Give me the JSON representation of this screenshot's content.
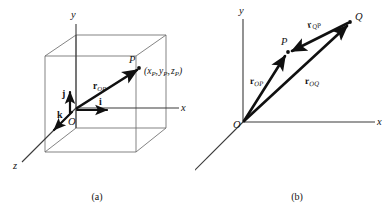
{
  "figure": {
    "background_color": "#ffffff",
    "ink_color": "#101010",
    "axis_color": "#3a3a3a",
    "cube_edge_color": "#6e6e6e"
  },
  "panel_a": {
    "caption": "(a)",
    "axes": [
      {
        "name": "y-axis",
        "label": "y"
      },
      {
        "name": "x-axis",
        "label": "x"
      },
      {
        "name": "z-axis",
        "label": "z"
      }
    ],
    "origin_label": "O",
    "point_label": "P",
    "coordinate_label": {
      "open": "(",
      "x_base": "x",
      "x_sub": "P",
      "sep1": ",",
      "y_base": "y",
      "y_sub": "P",
      "sep2": ",",
      "z_base": "z",
      "z_sub": "P",
      "close": ")"
    },
    "unit_vectors": [
      {
        "name": "i-hat",
        "label": "i",
        "direction": "x"
      },
      {
        "name": "j-hat",
        "label": "j",
        "direction": "y"
      },
      {
        "name": "k-hat",
        "label": "k",
        "direction": "z"
      }
    ],
    "vectors": [
      {
        "name": "r-OP",
        "base": "r",
        "sub": "OP",
        "from": "O",
        "to": "P"
      }
    ]
  },
  "panel_b": {
    "caption": "(b)",
    "axes": [
      {
        "name": "y-axis",
        "label": "y"
      },
      {
        "name": "x-axis",
        "label": "x"
      },
      {
        "name": "z-axis",
        "label": "z"
      }
    ],
    "origin_label": "O",
    "point_labels": [
      {
        "name": "point-P",
        "label": "P"
      },
      {
        "name": "point-Q",
        "label": "Q"
      }
    ],
    "vectors": [
      {
        "name": "r-OP",
        "base": "r",
        "sub": "OP",
        "from": "O",
        "to": "P"
      },
      {
        "name": "r-OQ",
        "base": "r",
        "sub": "OQ",
        "from": "O",
        "to": "Q"
      },
      {
        "name": "r-QP",
        "base": "r",
        "sub": "QP",
        "from": "Q",
        "to": "P"
      }
    ]
  }
}
